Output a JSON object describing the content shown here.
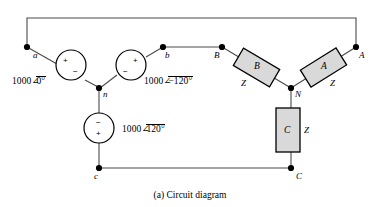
{
  "figure": {
    "caption": "(a) Circuit diagram",
    "colors": {
      "wire": "#4a4a4a",
      "outline": "#000000",
      "box_fill": "#d9d9d9",
      "node_dot": "#000000",
      "background": "#ffffff"
    }
  },
  "sources": [
    {
      "id": "source-a",
      "label": "1000",
      "angle": "0°",
      "angle_symbol": "∠",
      "plus": "+",
      "minus": "−"
    },
    {
      "id": "source-b",
      "label": "1000",
      "angle": "−120°",
      "angle_symbol": "∠",
      "plus": "+",
      "minus": "−"
    },
    {
      "id": "source-c",
      "label": "1000",
      "angle": "120°",
      "angle_symbol": "∠",
      "plus": "+",
      "minus": "−"
    }
  ],
  "source_nodes": {
    "a": "a",
    "b": "b",
    "c": "c",
    "n": "n"
  },
  "load_nodes": {
    "A": "A",
    "B": "B",
    "C": "C",
    "N": "N"
  },
  "impedances": [
    {
      "id": "impedance-a",
      "phase": "A",
      "z": "Z"
    },
    {
      "id": "impedance-b",
      "phase": "B",
      "z": "Z"
    },
    {
      "id": "impedance-c",
      "phase": "C",
      "z": "Z"
    }
  ]
}
